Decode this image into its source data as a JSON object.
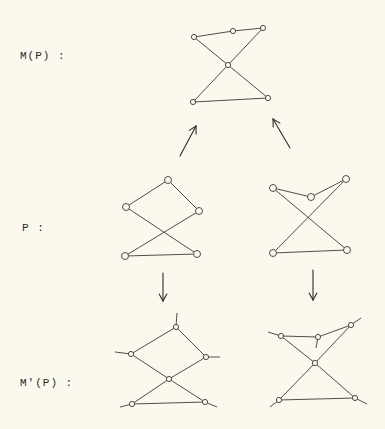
{
  "labels": {
    "mp": "M(P) :",
    "p": "P :",
    "mprime": "M'(P) :"
  },
  "colors": {
    "background": "#fbf9ee",
    "ink": "#3a3a3a"
  },
  "diagrams": {
    "mp": {
      "nodes": [
        [
          194,
          37
        ],
        [
          233,
          31
        ],
        [
          263,
          28
        ],
        [
          228,
          65
        ],
        [
          193,
          102
        ],
        [
          268,
          98
        ]
      ],
      "edges": [
        [
          0,
          1
        ],
        [
          1,
          2
        ],
        [
          0,
          3
        ],
        [
          2,
          3
        ],
        [
          3,
          4
        ],
        [
          3,
          5
        ],
        [
          4,
          5
        ]
      ]
    },
    "p_left": {
      "nodes": [
        [
          168,
          180
        ],
        [
          126,
          207
        ],
        [
          199,
          211
        ],
        [
          125,
          256
        ],
        [
          197,
          254
        ]
      ],
      "edges": [
        [
          0,
          1
        ],
        [
          0,
          2
        ],
        [
          1,
          4
        ],
        [
          2,
          3
        ],
        [
          3,
          4
        ]
      ]
    },
    "p_right": {
      "nodes": [
        [
          273,
          188
        ],
        [
          311,
          197
        ],
        [
          346,
          179
        ],
        [
          273,
          253
        ],
        [
          347,
          250
        ]
      ],
      "edges": [
        [
          0,
          1
        ],
        [
          1,
          2
        ],
        [
          0,
          4
        ],
        [
          2,
          3
        ],
        [
          3,
          4
        ]
      ]
    },
    "mprime_left": {
      "nodes": [
        [
          176,
          327
        ],
        [
          131,
          354
        ],
        [
          206,
          357
        ],
        [
          169,
          379
        ],
        [
          132,
          404
        ],
        [
          205,
          402
        ]
      ],
      "edges": [
        [
          0,
          1
        ],
        [
          0,
          2
        ],
        [
          1,
          3
        ],
        [
          2,
          3
        ],
        [
          3,
          4
        ],
        [
          3,
          5
        ],
        [
          4,
          5
        ]
      ],
      "stubs": [
        [
          [
            176,
            327
          ],
          [
            177,
            313
          ]
        ],
        [
          [
            131,
            354
          ],
          [
            115,
            352
          ]
        ],
        [
          [
            206,
            357
          ],
          [
            220,
            357
          ]
        ],
        [
          [
            132,
            404
          ],
          [
            120,
            407
          ]
        ],
        [
          [
            205,
            402
          ],
          [
            217,
            407
          ]
        ]
      ]
    },
    "mprime_right": {
      "nodes": [
        [
          281,
          336
        ],
        [
          318,
          337
        ],
        [
          351,
          325
        ],
        [
          315,
          363
        ],
        [
          279,
          400
        ],
        [
          355,
          398
        ]
      ],
      "edges": [
        [
          0,
          1
        ],
        [
          1,
          2
        ],
        [
          0,
          3
        ],
        [
          2,
          3
        ],
        [
          3,
          4
        ],
        [
          3,
          5
        ],
        [
          4,
          5
        ]
      ],
      "stubs": [
        [
          [
            281,
            336
          ],
          [
            268,
            332
          ]
        ],
        [
          [
            318,
            337
          ],
          [
            316,
            348
          ]
        ],
        [
          [
            351,
            325
          ],
          [
            361,
            318
          ]
        ],
        [
          [
            279,
            400
          ],
          [
            270,
            407
          ]
        ],
        [
          [
            355,
            398
          ],
          [
            367,
            404
          ]
        ]
      ]
    }
  },
  "arrows": [
    {
      "from": [
        180,
        156
      ],
      "to": [
        196,
        126
      ]
    },
    {
      "from": [
        290,
        148
      ],
      "to": [
        273,
        119
      ]
    },
    {
      "from": [
        163,
        273
      ],
      "to": [
        163,
        301
      ]
    },
    {
      "from": [
        313,
        270
      ],
      "to": [
        313,
        300
      ]
    }
  ]
}
